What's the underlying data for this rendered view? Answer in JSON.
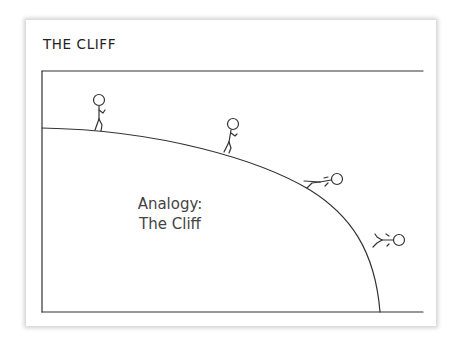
{
  "slide": {
    "title": "THE CLIFF",
    "label_line1": "Analogy:",
    "label_line2": "The Cliff"
  },
  "illustration": {
    "description": "Stick figure walking, then falling off a curved cliff edge",
    "figures": [
      "walking",
      "walking-downhill",
      "sliding",
      "falling"
    ],
    "line_color": "#333333"
  }
}
